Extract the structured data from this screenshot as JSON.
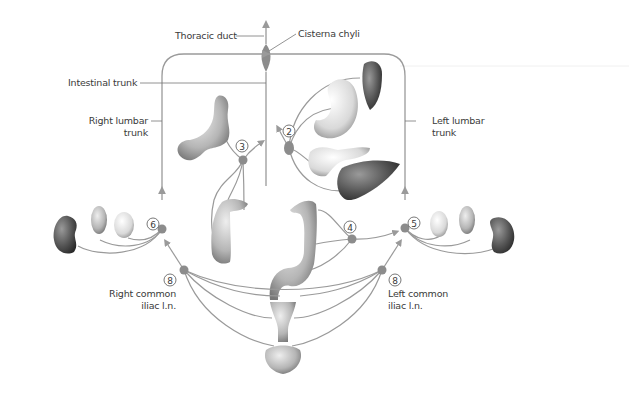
{
  "diagram": {
    "colors": {
      "line": "#9a9a9a",
      "node": "#8c8c8c",
      "text": "#3a3a3a",
      "organ_light": "#e6e6e6",
      "organ_mid": "#b8b8b8",
      "organ_dark": "#555555"
    },
    "labels": {
      "thoracic_duct": "Thoracic duct",
      "cisterna_chyli": "Cisterna chyli",
      "intestinal_trunk": "Intestinal trunk",
      "right_lumbar_trunk_1": "Right lumbar",
      "right_lumbar_trunk_2": "trunk",
      "left_lumbar_trunk_1": "Left lumbar",
      "left_lumbar_trunk_2": "trunk",
      "right_common_iliac_1": "Right common",
      "right_common_iliac_2": "iliac l.n.",
      "left_common_iliac_1": "Left common",
      "left_common_iliac_2": "iliac l.n."
    },
    "node_numbers": {
      "celiac": "2",
      "superior_mesenteric": "3",
      "inferior_mesenteric": "4",
      "left_lumbar": "5",
      "right_lumbar": "6",
      "right_common_iliac": "8",
      "left_common_iliac": "8"
    },
    "organs": [
      "spleen",
      "stomach",
      "pancreas",
      "liver",
      "small-intestine",
      "ascending-colon",
      "descending-colon",
      "sigmoid-colon",
      "right-kidney",
      "right-adrenal",
      "right-gonad",
      "left-kidney",
      "left-adrenal",
      "left-gonad",
      "uterus",
      "bladder"
    ]
  }
}
